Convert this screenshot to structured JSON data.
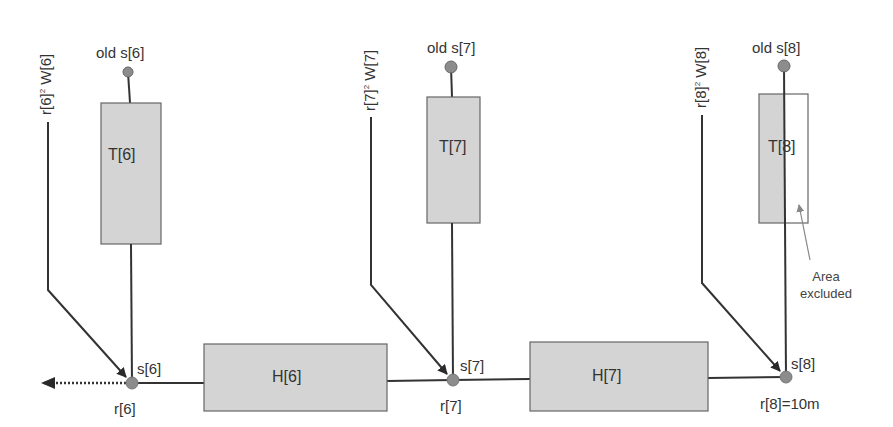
{
  "diagram": {
    "colors": {
      "box_fill": "#d4d4d4",
      "box_stroke": "#666666",
      "line": "#333333",
      "node": "#8c8c8c",
      "annotation_arrow": "#888888"
    },
    "stages": [
      {
        "index": 6,
        "old_s_label": "old s[6]",
        "t_label": "T[6]",
        "w_label_prefix": "r[6]",
        "w_label_exp": "2",
        "w_label_suffix": " W[6]",
        "s_label": "s[6]",
        "r_label": "r[6]"
      },
      {
        "index": 7,
        "old_s_label": "old s[7]",
        "t_label": "T[7]",
        "w_label_prefix": "r[7]",
        "w_label_exp": "2",
        "w_label_suffix": " W[7]",
        "s_label": "s[7]",
        "r_label": "r[7]"
      },
      {
        "index": 8,
        "old_s_label": "old s[8]",
        "t_label": "T[8]",
        "w_label_prefix": "r[8]",
        "w_label_exp": "2",
        "w_label_suffix": " W[8]",
        "s_label": "s[8]",
        "r_label": "r[8]=10m"
      }
    ],
    "h_boxes": [
      {
        "label": "H[6]"
      },
      {
        "label": "H[7]"
      }
    ],
    "annotation": {
      "line1": "Area",
      "line2": "excluded"
    }
  }
}
